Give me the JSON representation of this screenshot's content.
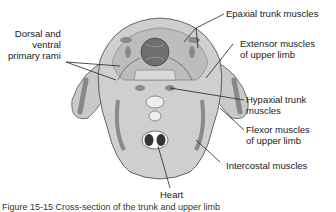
{
  "figure": {
    "labels": {
      "dorsal_ventral_rami": [
        "Dorsal and",
        "ventral",
        "primary rami"
      ],
      "epaxial": "Epaxial trunk muscles",
      "extensor": [
        "Extensor muscles",
        "of upper limb"
      ],
      "hypaxial": [
        "Hypaxial trunk",
        "muscles"
      ],
      "flexor": [
        "Flexor muscles",
        "of upper limb"
      ],
      "intercostal": "Intercostal muscles",
      "heart": "Heart"
    },
    "caption_partial": "Figure 15-15  Cross-section of the trunk and upper limb"
  }
}
